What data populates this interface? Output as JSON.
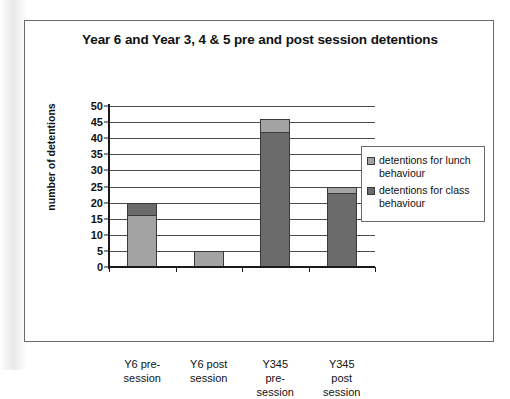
{
  "chart_data": {
    "type": "bar",
    "subtype": "stacked-column",
    "title": "Year 6 and Year 3, 4 & 5 pre and post session detentions",
    "xlabel": "",
    "ylabel": "number of detentions",
    "ylim": [
      0,
      50
    ],
    "ytick_step": 5,
    "yticks": [
      "50",
      "45",
      "40",
      "35",
      "30",
      "25",
      "20",
      "15",
      "10",
      "5",
      "0"
    ],
    "grid": true,
    "grid_axis": "y",
    "legend_position": "right",
    "categories": [
      "Y6 pre-session",
      "Y6 post session",
      "Y345 pre-session",
      "Y345 post session"
    ],
    "category_lines": [
      [
        "Y6 pre-",
        "session"
      ],
      [
        "Y6 post",
        "session"
      ],
      [
        "Y345",
        "pre-",
        "session"
      ],
      [
        "Y345",
        "post",
        "session"
      ]
    ],
    "series": [
      {
        "name": "detentions for class behaviour",
        "color": "#6b6b6b",
        "values": [
          4,
          0,
          42,
          23
        ]
      },
      {
        "name": "detentions for lunch behaviour",
        "color": "#a3a3a3",
        "values": [
          16,
          5,
          4,
          2
        ]
      }
    ],
    "stack_totals": [
      20,
      5,
      46,
      25
    ]
  },
  "legend": {
    "items": [
      {
        "label": "detentions for lunch behaviour",
        "color": "#a3a3a3"
      },
      {
        "label": "detentions for class behaviour",
        "color": "#6b6b6b"
      }
    ]
  },
  "colors": {
    "lunch": "#a3a3a3",
    "class": "#6b6b6b",
    "axis": "#1a1a1a",
    "grid": "#4d4d4d",
    "frame": "#6b6b6b",
    "text": "#111111",
    "background": "#ffffff"
  }
}
